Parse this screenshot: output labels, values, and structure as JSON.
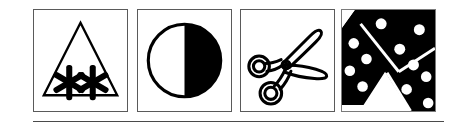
{
  "figure": {
    "name": "pictogram-panel-strip",
    "panel_count": 4,
    "background_color": "#ffffff",
    "ink_color": "#000000",
    "frame_color": "#5a5a5a",
    "rule_color": "#4a4a4a",
    "panels": [
      {
        "index": 1,
        "icon_name": "snowflake-triangle-icon",
        "label": "Triangle with two snowflakes",
        "description": "Outlined upward-pointing triangle containing two six-pointed asterisk snowflake glyphs",
        "style": "line art, black on white",
        "elements": [
          "triangle-outline",
          "snowflake-left",
          "snowflake-right"
        ]
      },
      {
        "index": 2,
        "icon_name": "half-filled-circle-icon",
        "label": "Circle half filled black",
        "description": "Outlined circle with the right half solid black",
        "style": "line art, black on white",
        "elements": [
          "circle-outline",
          "right-half-fill"
        ]
      },
      {
        "index": 3,
        "icon_name": "scissors-icon",
        "label": "Open scissors",
        "description": "Pair of open scissors with two ring handles at left and two blades extending right",
        "style": "line art, black outline on white",
        "elements": [
          "ring-handle-upper",
          "ring-handle-lower",
          "blade-upper",
          "blade-lower",
          "pivot-screw"
        ]
      },
      {
        "index": 4,
        "icon_name": "dominoes-icon",
        "label": "Dominoes with pips",
        "description": "Black domino tiles placed at angles with white round pips, forming a pinwheel arrangement",
        "style": "solid black fill with white dots",
        "elements": [
          "domino-top-left",
          "domino-top-right",
          "domino-lower-right",
          "white-wedge"
        ]
      }
    ],
    "footer_rule": {
      "name": "horizontal-rule",
      "visible": true
    }
  }
}
